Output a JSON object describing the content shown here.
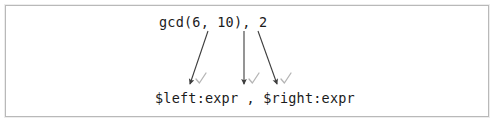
{
  "figure": {
    "title_text": "",
    "background_color": "#ffffff",
    "border_color": "#b9b9b9",
    "text_color": "#1b1b1b",
    "arrow_color": "#3d3d3d",
    "check_color": "#b5b5b5"
  },
  "source": {
    "label": "gcd(6, 10), 2",
    "tokens": [
      {
        "text": "gcd(6, 10)",
        "role": "left-expression"
      },
      {
        "text": ",",
        "role": "separator"
      },
      {
        "text": "2",
        "role": "right-expression"
      }
    ]
  },
  "pattern": {
    "label": "$left:expr , $right:expr",
    "tokens": [
      {
        "text": "$left:expr",
        "role": "left-metavariable"
      },
      {
        "text": ",",
        "role": "separator"
      },
      {
        "text": "$right:expr",
        "role": "right-metavariable"
      }
    ]
  },
  "mappings": [
    {
      "name": "left-expression-match",
      "from": "gcd(6, 10)",
      "to": "$left:expr",
      "status": "matched",
      "check": "✓",
      "x1": 208,
      "y1": 31,
      "x2": 190,
      "y2": 84,
      "check_x": 196,
      "check_y": 73
    },
    {
      "name": "separator-match",
      "from": ",",
      "to": ",",
      "status": "matched",
      "check": "✓",
      "x1": 244,
      "y1": 31,
      "x2": 244,
      "y2": 84,
      "check_x": 249,
      "check_y": 73
    },
    {
      "name": "right-expression-match",
      "from": "2",
      "to": "$right:expr",
      "status": "matched",
      "check": "✓",
      "x1": 258,
      "y1": 31,
      "x2": 277,
      "y2": 84,
      "check_x": 281,
      "check_y": 73
    }
  ]
}
